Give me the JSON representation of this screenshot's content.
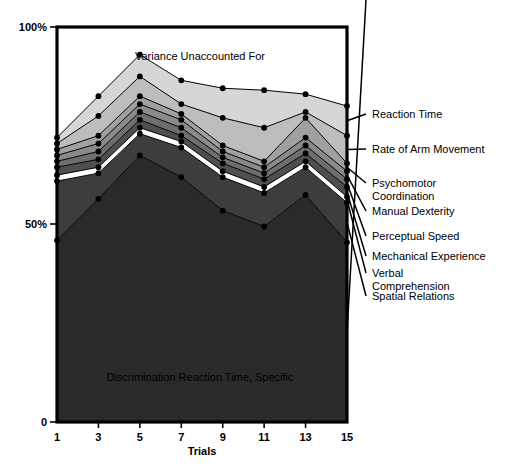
{
  "chart_data": {
    "type": "area",
    "title": "",
    "xlabel": "Trials",
    "ylabel": "",
    "x": [
      1,
      3,
      5,
      7,
      9,
      11,
      13,
      15
    ],
    "xticklabels": [
      "1",
      "3",
      "5",
      "7",
      "9",
      "11",
      "13",
      "15"
    ],
    "yticklabels": [
      "100%",
      "50%",
      "0"
    ],
    "ylim": [
      0,
      100
    ],
    "yticks": [
      0,
      50,
      100
    ],
    "grid": false,
    "legend_position": "right-outside-with-leader-lines",
    "stacked": true,
    "stack_order": "bottom-to-top",
    "series": [
      {
        "name": "Discrimination Reaction Time, Specific",
        "color": "#2a2a2a",
        "cumulative_top": [
          46.0,
          56.5,
          67.5,
          62.0,
          53.5,
          49.5,
          57.5,
          45.5
        ]
      },
      {
        "name": "Spatial Relations",
        "color": "#3d3d3d",
        "cumulative_top": [
          61.0,
          63.0,
          73.0,
          69.5,
          62.0,
          58.0,
          64.5,
          55.5
        ]
      },
      {
        "name": "Verbal Comprehension",
        "color": "#ffffff",
        "cumulative_top": [
          62.5,
          64.5,
          74.5,
          71.0,
          63.5,
          59.5,
          66.0,
          57.0
        ]
      },
      {
        "name": "Mechanical Experience",
        "color": "#4f4f4f",
        "cumulative_top": [
          64.5,
          66.5,
          76.5,
          72.5,
          65.5,
          61.5,
          68.0,
          59.5
        ]
      },
      {
        "name": "Perceptual Speed",
        "color": "#6e6e6e",
        "cumulative_top": [
          66.0,
          68.5,
          78.5,
          74.5,
          67.0,
          63.0,
          70.0,
          61.5
        ]
      },
      {
        "name": "Manual Dexterity",
        "color": "#8a8a8a",
        "cumulative_top": [
          67.5,
          70.5,
          80.5,
          76.5,
          68.5,
          64.5,
          72.0,
          63.5
        ]
      },
      {
        "name": "Psychomotor Coordination",
        "color": "#a0a0a0",
        "cumulative_top": [
          69.0,
          72.5,
          82.5,
          78.0,
          70.0,
          66.0,
          77.0,
          65.5
        ]
      },
      {
        "name": "Rate of Arm Movement",
        "color": "#bdbdbd",
        "cumulative_top": [
          70.5,
          77.5,
          87.5,
          80.5,
          77.0,
          74.5,
          78.5,
          72.5
        ]
      },
      {
        "name": "Reaction Time",
        "color": "#d6d6d6",
        "cumulative_top": [
          72.0,
          82.5,
          93.0,
          86.5,
          84.5,
          84.0,
          83.0,
          80.0
        ]
      }
    ],
    "annotations": [
      {
        "text": "Variance Unaccounted For",
        "x_px": 200,
        "y_px": 56
      },
      {
        "text": "Discrimination Reaction Time, Specific",
        "x_px": 200,
        "y_px": 377
      }
    ]
  },
  "labels": {
    "y_top": "100%",
    "y_mid": "50%",
    "y_bottom": "0",
    "x_axis_title": "Trials",
    "ticks_x": [
      "1",
      "3",
      "5",
      "7",
      "9",
      "11",
      "13",
      "15"
    ],
    "annotation_top": "Variance Unaccounted For",
    "annotation_bottom": "Discrimination Reaction Time, Specific",
    "series_callouts": [
      {
        "text": "Reaction Time",
        "line1": "Reaction Time",
        "line2": ""
      },
      {
        "text": "Rate of Arm Movement",
        "line1": "Rate of Arm Movement",
        "line2": ""
      },
      {
        "text": "Psychomotor Coordination",
        "line1": "Psychomotor",
        "line2": "Coordination"
      },
      {
        "text": "Manual Dexterity",
        "line1": "Manual Dexterity",
        "line2": ""
      },
      {
        "text": "Perceptual Speed",
        "line1": "Perceptual Speed",
        "line2": ""
      },
      {
        "text": "Mechanical Experience",
        "line1": "Mechanical Experience",
        "line2": ""
      },
      {
        "text": "Verbal Comprehension",
        "line1": "Verbal",
        "line2": "Comprehension"
      },
      {
        "text": "Spatial Relations",
        "line1": "Spatial Relations",
        "line2": ""
      }
    ]
  },
  "colors": {
    "axis": "#000000",
    "background": "#ffffff",
    "marker": "#000000"
  }
}
